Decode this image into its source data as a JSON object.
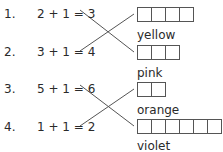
{
  "exercise": {
    "equations": [
      {
        "number": "1.",
        "text": "2 + 1 = 3"
      },
      {
        "number": "2.",
        "text": "3 + 1 = 4"
      },
      {
        "number": "3.",
        "text": "5 + 1 = 6"
      },
      {
        "number": "4.",
        "text": "1 + 1 = 2"
      }
    ],
    "answers": [
      {
        "word": "yellow",
        "box_count": 4
      },
      {
        "word": "pink",
        "box_count": 3
      },
      {
        "word": "orange",
        "box_count": 2
      },
      {
        "word": "violet",
        "box_count": 6
      }
    ]
  }
}
